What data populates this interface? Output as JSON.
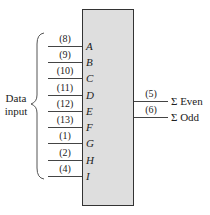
{
  "diagram": {
    "type": "parity-generator-chip",
    "input_group_label_line1": "Data",
    "input_group_label_line2": "input",
    "inputs": [
      {
        "label": "A",
        "pin": "(8)"
      },
      {
        "label": "B",
        "pin": "(9)"
      },
      {
        "label": "C",
        "pin": "(10)"
      },
      {
        "label": "D",
        "pin": "(11)"
      },
      {
        "label": "E",
        "pin": "(12)"
      },
      {
        "label": "F",
        "pin": "(13)"
      },
      {
        "label": "G",
        "pin": "(1)"
      },
      {
        "label": "H",
        "pin": "(2)"
      },
      {
        "label": "I",
        "pin": "(4)"
      }
    ],
    "outputs": [
      {
        "label": "Σ Even",
        "pin": "(5)"
      },
      {
        "label": "Σ Odd",
        "pin": "(6)"
      }
    ],
    "colors": {
      "chip_fill": "#dedede",
      "chip_border": "#333333",
      "wire": "#444444"
    }
  }
}
